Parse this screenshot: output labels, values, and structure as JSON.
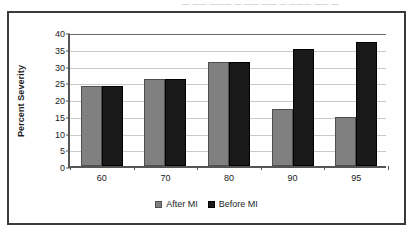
{
  "scan_artifact_text": "— —— ——— — —— —— — ——— —— —",
  "colors": {
    "after_mi": "#808080",
    "before_mi": "#1a1a1a",
    "gridline": "#c9c9c9",
    "axis": "#555555",
    "frame_border": "#3a3a3a"
  },
  "chart_data": {
    "type": "bar",
    "title": "",
    "subtitle": "",
    "xlabel": "",
    "ylabel": "Percent Severity",
    "categories": [
      "60",
      "70",
      "80",
      "90",
      "95"
    ],
    "series": [
      {
        "name": "After MI",
        "values": [
          24,
          26,
          31,
          17,
          14.5
        ]
      },
      {
        "name": "Before MI",
        "values": [
          24,
          26,
          31,
          35,
          37
        ]
      }
    ],
    "ylim": [
      0,
      40
    ],
    "ytick_step": 5,
    "yticks": [
      0,
      5,
      10,
      15,
      20,
      25,
      30,
      35,
      40
    ],
    "ytick_labels": [
      "0",
      "5",
      "10",
      "15",
      "20",
      "25",
      "30",
      "35",
      "40"
    ],
    "grid": true,
    "grid_axis": "y",
    "legend": true,
    "legend_position": "bottom",
    "legend_entries": [
      "After MI",
      "Before MI"
    ],
    "bar_grouping": "clustered"
  }
}
